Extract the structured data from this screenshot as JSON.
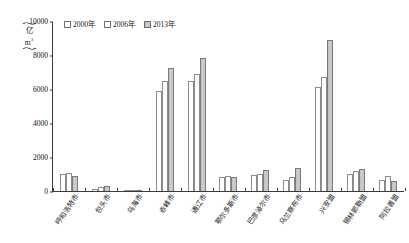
{
  "chart_data": {
    "type": "bar",
    "title": "",
    "xlabel": "",
    "ylabel": "(亿 m3)",
    "ylim": [
      0,
      10000
    ],
    "yticks": [
      0,
      2000,
      4000,
      6000,
      8000,
      10000
    ],
    "ytick_labels": [
      "0",
      "2000",
      "4000",
      "6000",
      "8000",
      "10000"
    ],
    "grid": false,
    "legend_position": "top-left",
    "unit_line1": "亿",
    "unit_line2": "m",
    "unit_exponent": "3",
    "categories": [
      "呼和浩特市",
      "包头市",
      "乌海市",
      "赤峰市",
      "通辽市",
      "鄂尔多斯市",
      "巴彦淖尔市",
      "乌兰察布市",
      "兴安盟",
      "锡林郭勒盟",
      "阿拉善盟"
    ],
    "series": [
      {
        "name": "2000年",
        "color": "#ffffff",
        "values": [
          1000,
          100,
          60,
          5900,
          6500,
          850,
          930,
          650,
          6100,
          1000,
          630
        ]
      },
      {
        "name": "2006年",
        "color": "#ffffff",
        "values": [
          1060,
          220,
          70,
          6500,
          6900,
          880,
          1000,
          820,
          6700,
          1150,
          880
        ]
      },
      {
        "name": "2013年",
        "color": "#c9c9c9",
        "values": [
          900,
          320,
          80,
          7250,
          7800,
          820,
          1250,
          1350,
          8900,
          1270,
          560
        ]
      }
    ]
  }
}
